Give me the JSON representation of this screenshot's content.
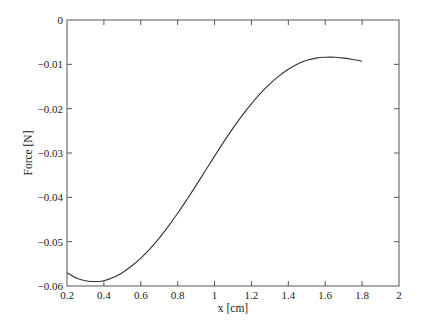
{
  "chart_data": {
    "type": "line",
    "title": "",
    "xlabel": "x [cm]",
    "ylabel": "Force [N]",
    "xlim": [
      0.2,
      2.0
    ],
    "ylim": [
      -0.06,
      0.0
    ],
    "grid": false,
    "legend": null,
    "x_ticks": [
      0.2,
      0.4,
      0.6,
      0.8,
      1.0,
      1.2,
      1.4,
      1.6,
      1.8,
      2.0
    ],
    "x_tick_labels": [
      "0.2",
      "0.4",
      "0.6",
      "0.8",
      "1",
      "1.2",
      "1.4",
      "1.6",
      "1.8",
      "2"
    ],
    "y_ticks": [
      0.0,
      -0.01,
      -0.02,
      -0.03,
      -0.04,
      -0.05,
      -0.06
    ],
    "y_tick_labels": [
      "0",
      "−0.01",
      "−0.02",
      "−0.03",
      "−0.04",
      "−0.05",
      "−0.06"
    ],
    "series": [
      {
        "name": "Force",
        "color": "#333333",
        "x": [
          0.2,
          0.25,
          0.3,
          0.35,
          0.4,
          0.45,
          0.5,
          0.55,
          0.6,
          0.65,
          0.7,
          0.75,
          0.8,
          0.85,
          0.9,
          0.95,
          1.0,
          1.05,
          1.1,
          1.15,
          1.2,
          1.25,
          1.3,
          1.35,
          1.4,
          1.45,
          1.5,
          1.55,
          1.6,
          1.65,
          1.7,
          1.75,
          1.8
        ],
        "y": [
          -0.057,
          -0.0582,
          -0.0588,
          -0.059,
          -0.0588,
          -0.0581,
          -0.057,
          -0.0555,
          -0.0537,
          -0.0516,
          -0.0492,
          -0.0465,
          -0.0436,
          -0.0405,
          -0.0373,
          -0.034,
          -0.0307,
          -0.0275,
          -0.0244,
          -0.0215,
          -0.0189,
          -0.0165,
          -0.0144,
          -0.0126,
          -0.0111,
          -0.0099,
          -0.0091,
          -0.0086,
          -0.0084,
          -0.0084,
          -0.0086,
          -0.0089,
          -0.0093
        ]
      }
    ]
  },
  "plot": {
    "left": 67,
    "right": 399,
    "top": 20,
    "bottom": 286,
    "axis_color": "#555555",
    "tick_length": 5
  }
}
